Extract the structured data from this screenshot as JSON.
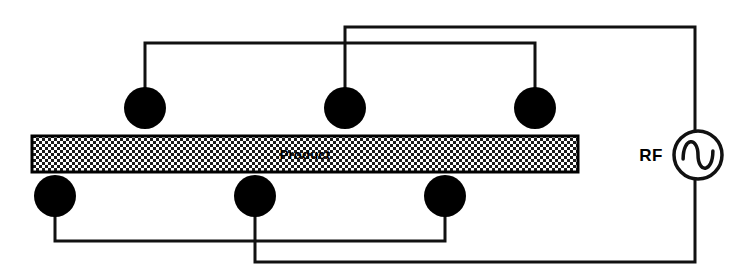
{
  "diagram": {
    "background_color": "#ffffff",
    "wire_color": "#111111",
    "electrode_color": "#000000",
    "product": {
      "label": "Product",
      "fill_pattern": "checkerboard",
      "pattern_light": "#ffffff",
      "pattern_dark": "#1a1a1a",
      "border_color": "#000000",
      "x": 32,
      "y": 136,
      "width": 546,
      "height": 36
    },
    "source": {
      "label": "RF",
      "symbol": "ac-sine-source",
      "cx": 698,
      "cy": 155,
      "r": 24,
      "label_x": 651,
      "label_y": 161
    },
    "top_electrodes": [
      {
        "name": "top-electrode-1",
        "cx": 145,
        "cy": 108,
        "rx": 21,
        "ry": 21
      },
      {
        "name": "top-electrode-2",
        "cx": 345,
        "cy": 108,
        "rx": 21,
        "ry": 21
      },
      {
        "name": "top-electrode-3",
        "cx": 535,
        "cy": 108,
        "rx": 21,
        "ry": 21
      }
    ],
    "bottom_electrodes": [
      {
        "name": "bottom-electrode-1",
        "cx": 55,
        "cy": 196,
        "rx": 21,
        "ry": 21
      },
      {
        "name": "bottom-electrode-2",
        "cx": 255,
        "cy": 196,
        "rx": 21,
        "ry": 21
      },
      {
        "name": "bottom-electrode-3",
        "cx": 445,
        "cy": 196,
        "rx": 21,
        "ry": 21
      }
    ],
    "buses": {
      "top_outer_y": 27,
      "top_inner_y": 43,
      "bottom_inner_y": 241,
      "bottom_outer_y": 262,
      "right_rail_x": 695
    },
    "wire_paths": {
      "top_inner_bus": "M 145 108 L 145 43 L 535 43 L 535 108",
      "top_outer_bus": "M 345 108 L 345 27 L 695 27 L 695 131",
      "bottom_inner_bus": "M 55 196 L 55 241 L 445 241 L 445 196",
      "bottom_outer_bus": "M 255 196 L 255 262 L 695 262 L 695 179"
    }
  }
}
